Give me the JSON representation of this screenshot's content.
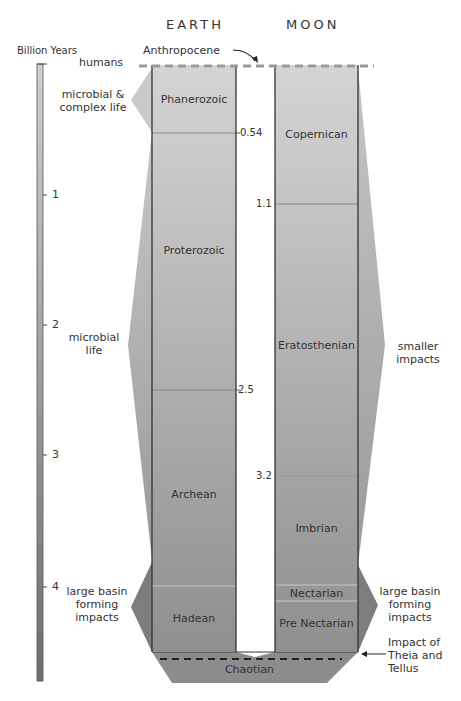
{
  "headers": {
    "earth": "EARTH",
    "moon": "MOON"
  },
  "scale": {
    "label": "Billion Years",
    "ticks": [
      {
        "value": "1",
        "y": 195
      },
      {
        "value": "2",
        "y": 325
      },
      {
        "value": "3",
        "y": 455
      },
      {
        "value": "4",
        "y": 587
      }
    ]
  },
  "top_annotation": {
    "anthropocene": "Anthropocene",
    "humans": "humans"
  },
  "earth": {
    "eons": [
      {
        "name": "Phanerozoic",
        "start_ga": 0,
        "end_ga": 0.54
      },
      {
        "name": "Proterozoic",
        "start_ga": 0.54,
        "end_ga": 2.5
      },
      {
        "name": "Archean",
        "start_ga": 2.5,
        "end_ga": 4.0
      },
      {
        "name": "Hadean",
        "start_ga": 4.0,
        "end_ga": 4.5
      }
    ],
    "boundary_labels": [
      "0.54",
      "2.5"
    ],
    "life_annotations": {
      "complex": "microbial & complex life",
      "complex_line1": "microbial &",
      "complex_line2": "complex life",
      "microbial_line1": "microbial",
      "microbial_line2": "life",
      "impacts_line1": "large basin",
      "impacts_line2": "forming",
      "impacts_line3": "impacts"
    }
  },
  "moon": {
    "periods": [
      {
        "name": "Copernican",
        "start_ga": 0,
        "end_ga": 1.1
      },
      {
        "name": "Eratosthenian",
        "start_ga": 1.1,
        "end_ga": 3.2
      },
      {
        "name": "Imbrian",
        "start_ga": 3.2,
        "end_ga": 3.85
      },
      {
        "name": "Nectarian",
        "start_ga": 3.85,
        "end_ga": 3.92
      },
      {
        "name": "Pre Nectarian",
        "start_ga": 3.92,
        "end_ga": 4.5
      }
    ],
    "boundary_labels": [
      "1.1",
      "3.2"
    ],
    "impact_annotations": {
      "smaller_line1": "smaller",
      "smaller_line2": "impacts",
      "large_line1": "large basin",
      "large_line2": "forming",
      "large_line3": "impacts"
    }
  },
  "shared": {
    "chaotian": "Chaotian",
    "theia_line1": "Impact of",
    "theia_line2": "Theia and",
    "theia_line3": "Tellus"
  },
  "colors": {
    "column_top": "#d2d2d2",
    "column_bottom": "#8e8e8e",
    "annotation_fill_light": "#bdbdbd",
    "annotation_fill_dark": "#7a7a7a",
    "outline": "#333333",
    "anthropocene_dash": "#9a9a9a"
  }
}
